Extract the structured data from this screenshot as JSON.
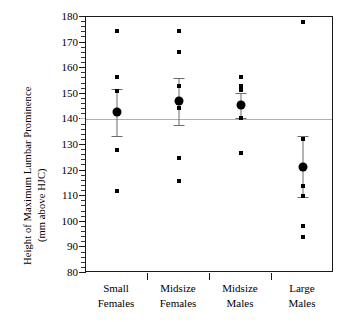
{
  "chart_data": {
    "type": "scatter",
    "title": "",
    "xlabel": "",
    "ylabel": "Height of Maximum Lumbar Prominence",
    "ylabel_line2": "(mm above HJC)",
    "ylim": [
      80,
      180
    ],
    "ytick_labels": [
      "180",
      "170",
      "160",
      "150",
      "140",
      "130",
      "120",
      "110",
      "100",
      "90",
      "80"
    ],
    "ytick_values": [
      180,
      170,
      160,
      150,
      140,
      130,
      120,
      110,
      100,
      90,
      80
    ],
    "ytick_major_step": 10,
    "ytick_minor_step": 2,
    "grid": false,
    "legend": "none",
    "reference_line": {
      "value": 140,
      "color": "#b0b0b0",
      "label": ""
    },
    "categories": [
      "Small Females",
      "Midsize Females",
      "Midsize Males",
      "Large Males"
    ],
    "category_lines": [
      [
        "Small",
        "Females"
      ],
      [
        "Midsize",
        "Females"
      ],
      [
        "Midsize",
        "Males"
      ],
      [
        "Large",
        "Males"
      ]
    ],
    "series": [
      {
        "name": "Small Females",
        "points": [
          174.5,
          156.5,
          151.0,
          128.0,
          112.0
        ],
        "mean": 143.0,
        "ci_low": 133.5,
        "ci_high": 152.0
      },
      {
        "name": "Midsize Females",
        "points": [
          174.5,
          166.5,
          153.0,
          144.5,
          125.0,
          116.0
        ],
        "mean": 147.0,
        "ci_low": 138.0,
        "ci_high": 156.0
      },
      {
        "name": "Midsize Males",
        "points": [
          156.5,
          153.0,
          151.5,
          140.5,
          127.0
        ],
        "mean": 145.5,
        "ci_low": 140.5,
        "ci_high": 150.5
      },
      {
        "name": "Large Males",
        "points": [
          178.0,
          132.5,
          114.0,
          110.0,
          98.5,
          94.0
        ],
        "mean": 121.5,
        "ci_low": 109.5,
        "ci_high": 133.5
      }
    ],
    "colors": {
      "marker": "#000000",
      "mean_marker": "#000000",
      "error_bar": "#6a6a6a",
      "axis": "#1a1a1a",
      "reference": "#b0b0b0",
      "background": "#ffffff"
    }
  }
}
